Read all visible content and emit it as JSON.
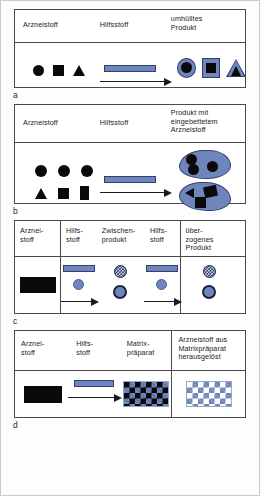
{
  "figure": {
    "accent_blue": "#6f86bd",
    "accent_blue_dark": "#31406b",
    "black": "#0a0a0a",
    "border_gray": "#4a4a4a"
  },
  "panels": [
    {
      "letter": "a",
      "headers": [
        "Arzneistoff",
        "Hilfsstoff",
        "umhülltes\nProdukt"
      ],
      "reactants": [
        "circle",
        "square",
        "triangle"
      ],
      "products": [
        "coated-circle",
        "coated-square",
        "coated-triangle"
      ],
      "arrow": "right-arrow",
      "excipient": "excipient-bar"
    },
    {
      "letter": "b",
      "headers": [
        "Arzneistoff",
        "Hilfsstoff",
        "Produkt mit\neingebettetem\nArzneistoff"
      ],
      "reactants_row1": [
        "circle",
        "circle",
        "circle"
      ],
      "reactants_row2": [
        "triangle",
        "square",
        "rectangle"
      ],
      "products": [
        "blob-with-3-circles",
        "blob-with-triangle-square-square"
      ],
      "arrow": "right-arrow",
      "excipient": "excipient-bar"
    },
    {
      "letter": "c",
      "headers": [
        "Arznei-\nstoff",
        "Hilfs-\nstoff",
        "Zwischen-\nprodukt",
        "Hilfs-\nstoff",
        "über-\nzogenes\nProdukt"
      ],
      "drug": "black-rectangle",
      "step1": {
        "excipient": "excipient-bar",
        "granule": "blue-pellet",
        "arrow": "right-arrow"
      },
      "intermediate": [
        "speckled-pellet",
        "coated-pellet"
      ],
      "step2": {
        "excipient": "excipient-bar",
        "granule": "blue-pellet",
        "arrow": "right-arrow"
      },
      "product": [
        "speckled-pellet",
        "coated-pellet"
      ]
    },
    {
      "letter": "d",
      "headers": [
        "Arznei-\nstoff",
        "Hilfs-\nstoff",
        "Matrix-\npräparat",
        "Arzneistoff aus\nMatrixpräparat\nherausgelöst"
      ],
      "drug": "black-rectangle",
      "excipient": "excipient-bar",
      "arrow": "right-arrow",
      "matrix": "checkerboard-black-blue",
      "leached": "checkerboard-white-blue"
    }
  ]
}
